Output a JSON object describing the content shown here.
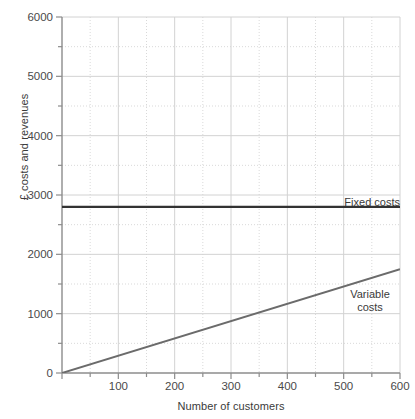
{
  "chart_data": {
    "type": "line",
    "title": "",
    "xlabel": "Number of customers",
    "ylabel": "£ costs and revenues",
    "xlim": [
      0,
      600
    ],
    "ylim": [
      0,
      6000
    ],
    "grid": true,
    "x_major_step": 100,
    "x_minor_step": 50,
    "y_major_step": 1000,
    "y_minor_step": 500,
    "xticks": [
      0,
      100,
      200,
      300,
      400,
      500,
      600
    ],
    "xtick_labels": [
      "",
      "100",
      "200",
      "300",
      "400",
      "500",
      "600"
    ],
    "yticks": [
      0,
      1000,
      2000,
      3000,
      4000,
      5000,
      6000
    ],
    "ytick_labels": [
      "0",
      "1000",
      "2000",
      "3000",
      "4000",
      "5000",
      "6000"
    ],
    "legend_position": "inline-annotations",
    "series": [
      {
        "name": "Fixed costs",
        "color": "#333333",
        "width": 2.4,
        "x": [
          0,
          600
        ],
        "values": [
          2800,
          2800
        ],
        "label": "Fixed costs",
        "label_x": 600,
        "label_y": 3000
      },
      {
        "name": "Variable costs",
        "color": "#6b6b6b",
        "width": 2.0,
        "x": [
          0,
          600
        ],
        "values": [
          0,
          1750
        ],
        "label": "Variable costs",
        "label_x": 540,
        "label_y": 1300
      }
    ],
    "annotations": [
      {
        "text": "Fixed costs",
        "x": 600,
        "y": 3000
      },
      {
        "text": "Variable costs",
        "x": 540,
        "y": 1300
      }
    ]
  },
  "axes": {
    "y_title": "£ costs and revenues",
    "x_title": "Number of customers",
    "y_labels": [
      "6000",
      "5000",
      "4000",
      "3000",
      "2000",
      "1000",
      "0"
    ],
    "x_labels": [
      "100",
      "200",
      "300",
      "400",
      "500",
      "600"
    ]
  },
  "labels": {
    "fixed_costs": "Fixed costs",
    "variable_costs": "Variable costs"
  },
  "colors": {
    "fixed_costs_line": "#333333",
    "variable_costs_line": "#6b6b6b",
    "major_grid": "#d6d6d6",
    "minor_grid": "#dcdcdc",
    "axis": "#8c8c8c",
    "text": "#3a3a3a"
  }
}
